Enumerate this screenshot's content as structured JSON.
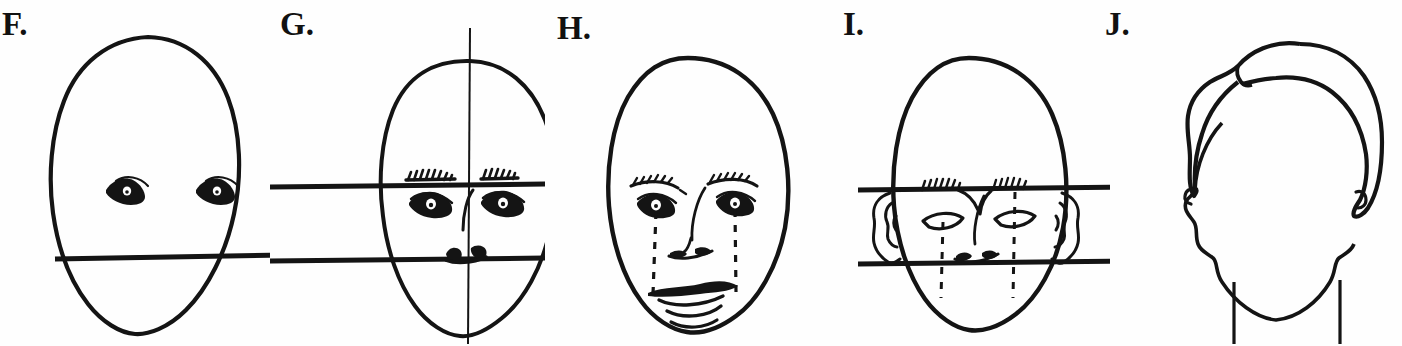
{
  "figure": {
    "background_color": "#fefefe",
    "ink_color": "#141414",
    "width": 1402,
    "height": 346,
    "panel_count": 5
  },
  "panels": [
    {
      "id": "panel-f",
      "label": "F.",
      "label_x": 2,
      "label_y": 8,
      "origin_x": 0,
      "description": "Blank egg-shaped head outline with a pair of eyes and one horizontal mouth guide line",
      "features": [
        "face-oval",
        "left-eye",
        "right-eye",
        "mouth-guide-line"
      ],
      "guide_lines": 1
    },
    {
      "id": "panel-g",
      "label": "G.",
      "label_x": 280,
      "label_y": 8,
      "origin_x": 270,
      "description": "Head oval with vertical centre axis, brow guide line, mouth guide line, eyebrows, eyes, nose line and lips",
      "features": [
        "face-oval",
        "vertical-center-axis",
        "brow-guide-line",
        "mouth-guide-line",
        "left-eyebrow",
        "right-eyebrow",
        "left-eye",
        "right-eye",
        "nose-line",
        "lips"
      ],
      "guide_lines": 2
    },
    {
      "id": "panel-h",
      "label": "H.",
      "label_x": 560,
      "label_y": 12,
      "origin_x": 545,
      "description": "Finished head with eyebrows, eyes, nose, lips, chin crease and two dashed vertical alignment lines dropping from the eyes to the mouth corners",
      "features": [
        "face-oval",
        "left-eyebrow",
        "right-eyebrow",
        "left-eye",
        "right-eye",
        "nose",
        "upper-lip",
        "lower-lip",
        "chin-crease",
        "dashed-alignment-line-left",
        "dashed-alignment-line-right"
      ],
      "guide_lines": 0,
      "dashed_lines": 2
    },
    {
      "id": "panel-i",
      "label": "I.",
      "label_x": 843,
      "label_y": 8,
      "origin_x": 830,
      "description": "Head with both ears drawn, two horizontal guide lines bracketing the ear band, eyebrows, almond eyes, nose and dashed vertical alignment lines",
      "features": [
        "face-oval",
        "brow-guide-line",
        "nose-base-guide-line",
        "left-ear",
        "right-ear",
        "left-eyebrow",
        "right-eyebrow",
        "left-eye",
        "right-eye",
        "nose",
        "dashed-alignment-line-left",
        "dashed-alignment-line-right"
      ],
      "guide_lines": 2,
      "dashed_lines": 2
    },
    {
      "id": "panel-j",
      "label": "J.",
      "label_x": 1105,
      "label_y": 8,
      "origin_x": 1110,
      "description": "Head outline with hair mass blocked in, ears and neck lines, no facial features",
      "features": [
        "face-outline",
        "hair-mass",
        "hair-part-line",
        "left-ear",
        "right-ear",
        "neck-line-left",
        "neck-line-right"
      ],
      "guide_lines": 0
    }
  ]
}
